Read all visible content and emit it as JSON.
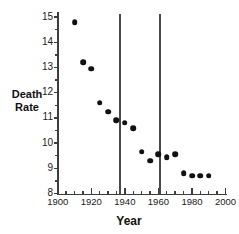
{
  "chart_data": {
    "type": "scatter",
    "title": "",
    "xlabel": "Year",
    "ylabel": "Death Rate",
    "xlim": [
      1900,
      2000
    ],
    "ylim": [
      8,
      15
    ],
    "grid": false,
    "legend": null,
    "x_ticks_major": [
      1900,
      1920,
      1940,
      1960,
      1980,
      2000
    ],
    "x_tick_labels": [
      "1900",
      "1920",
      "1940",
      "1960",
      "1980",
      "2000"
    ],
    "x_minor_tick_step": 5,
    "y_ticks": [
      8,
      9,
      10,
      11,
      12,
      13,
      14,
      15
    ],
    "y_tick_labels": [
      "8",
      "9",
      "10",
      "11",
      "12",
      "13",
      "14",
      "15"
    ],
    "y_minor_tick_step": 0.5,
    "x": [
      1910,
      1915,
      1920,
      1925,
      1930,
      1935,
      1940,
      1945,
      1950,
      1955,
      1960,
      1965,
      1970,
      1975,
      1980,
      1985,
      1990
    ],
    "values": [
      14.8,
      13.2,
      12.95,
      11.6,
      11.25,
      10.9,
      10.8,
      10.6,
      9.65,
      9.3,
      9.55,
      9.45,
      9.55,
      8.8,
      8.7,
      8.7,
      8.7
    ],
    "annotations": [
      {
        "type": "vline",
        "x": 1937,
        "label": ""
      },
      {
        "type": "vline",
        "x": 1961,
        "label": ""
      }
    ],
    "marker": "filled-circle",
    "marker_color": "#111111"
  },
  "labels": {
    "y_axis_title_line1": "Death",
    "y_axis_title_line2": "Rate",
    "x_axis_title": "Year"
  }
}
